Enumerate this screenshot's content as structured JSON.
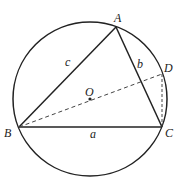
{
  "figure": {
    "type": "geometry",
    "circle": {
      "center": "O",
      "cx": 90,
      "cy": 99,
      "r": 77
    },
    "points": {
      "A": {
        "label": "A",
        "x": 116,
        "y": 27
      },
      "B": {
        "label": "B",
        "x": 19,
        "y": 127
      },
      "C": {
        "label": "C",
        "x": 162,
        "y": 127
      },
      "D": {
        "label": "D",
        "x": 162,
        "y": 74
      },
      "O": {
        "label": "O",
        "x": 90,
        "y": 99
      }
    },
    "sides": {
      "a": {
        "label": "a",
        "from": "B",
        "to": "C"
      },
      "b": {
        "label": "b",
        "from": "A",
        "to": "C"
      },
      "c": {
        "label": "c",
        "from": "A",
        "to": "B"
      }
    },
    "dashed_segments": [
      {
        "from": "B",
        "to": "D"
      },
      {
        "from": "D",
        "to": "C"
      }
    ],
    "colors": {
      "stroke": "#222222",
      "background": "#ffffff"
    }
  }
}
